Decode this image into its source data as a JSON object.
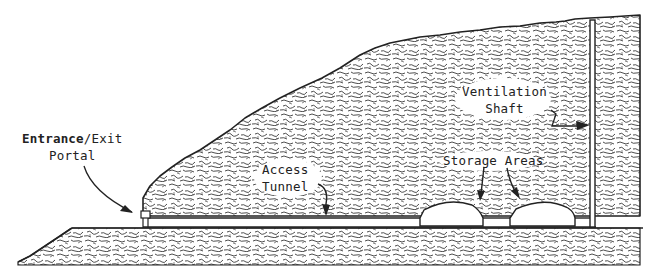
{
  "diagram": {
    "type": "cross-section",
    "colors": {
      "ink": "#222222",
      "background": "#ffffff",
      "rock_texture": "#3a3a3a"
    },
    "labels": {
      "portal": {
        "line1_bold": "Entrance",
        "line1_rest": "/Exit",
        "line2": "Portal"
      },
      "access_tunnel": {
        "line1": "Access",
        "line2": "Tunnel"
      },
      "storage_areas": {
        "line1": "Storage Areas"
      },
      "ventilation_shaft": {
        "line1": "Ventilation",
        "line2": "Shaft"
      }
    },
    "components": [
      "hillside-rock-mass",
      "ground-layer",
      "entrance-exit-portal",
      "access-tunnel",
      "storage-area-chamber-1",
      "storage-area-chamber-2",
      "ventilation-shaft"
    ]
  }
}
